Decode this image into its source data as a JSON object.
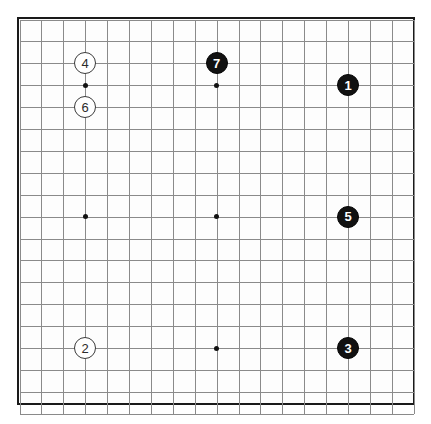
{
  "diagram": {
    "kind": "go-board-diagram",
    "board_size": 19
  },
  "board": {
    "origin_x": 20,
    "origin_y": 20,
    "spacing": 21.9,
    "border_color": "#1a1a1a",
    "grid_color": "#8a8a8a",
    "background_color": "#fdfdfd"
  },
  "star_points": [
    {
      "name": "star-point-upper-left",
      "col": 3,
      "row": 3,
      "visible": true
    },
    {
      "name": "star-point-upper-middle",
      "col": 9,
      "row": 3,
      "visible": true
    },
    {
      "name": "star-point-upper-right",
      "col": 15,
      "row": 3,
      "visible": false
    },
    {
      "name": "star-point-middle-left",
      "col": 3,
      "row": 9,
      "visible": true
    },
    {
      "name": "star-point-center",
      "col": 9,
      "row": 9,
      "visible": true
    },
    {
      "name": "star-point-middle-right",
      "col": 15,
      "row": 9,
      "visible": false
    },
    {
      "name": "star-point-lower-left",
      "col": 3,
      "row": 15,
      "visible": false
    },
    {
      "name": "star-point-lower-middle",
      "col": 9,
      "row": 15,
      "visible": true
    },
    {
      "name": "star-point-lower-right",
      "col": 15,
      "row": 15,
      "visible": false
    }
  ],
  "stones": [
    {
      "label": "1",
      "color": "black",
      "col": 15,
      "row": 3,
      "radius": 11
    },
    {
      "label": "2",
      "color": "white",
      "col": 3,
      "row": 15,
      "radius": 11
    },
    {
      "label": "3",
      "color": "black",
      "col": 15,
      "row": 15,
      "radius": 11
    },
    {
      "label": "4",
      "color": "white",
      "col": 3,
      "row": 2,
      "radius": 11
    },
    {
      "label": "5",
      "color": "black",
      "col": 15,
      "row": 9,
      "radius": 11
    },
    {
      "label": "6",
      "color": "white",
      "col": 3,
      "row": 4,
      "radius": 11
    },
    {
      "label": "7",
      "color": "black",
      "col": 9,
      "row": 2,
      "radius": 11
    }
  ],
  "colors": {
    "black_stone": "#111111",
    "white_stone": "#ffffff",
    "white_stone_outline": "#3a3a3a",
    "black_stone_text": "#ffffff",
    "white_stone_text": "#2b2b2b"
  }
}
